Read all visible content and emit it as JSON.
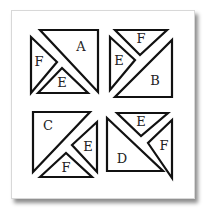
{
  "puzzle": {
    "quadrants": [
      {
        "id": "top-left",
        "pieces": [
          {
            "label": "A",
            "points": "40,30 98,30 98,92",
            "label_x": 81,
            "label_y": 47
          },
          {
            "label": "F",
            "points": "31,37 57,62 31,93",
            "label_x": 39,
            "label_y": 62
          },
          {
            "label": "E",
            "points": "38,93 62,68 88,93",
            "label_x": 62,
            "label_y": 83
          }
        ]
      },
      {
        "id": "top-right",
        "pieces": [
          {
            "label": "F",
            "points": "115,30 167,30 140,55",
            "label_x": 141,
            "label_y": 39
          },
          {
            "label": "E",
            "points": "110,37 135,60 110,90",
            "label_x": 119,
            "label_y": 61
          },
          {
            "label": "B",
            "points": "172,40 172,97 115,97",
            "label_x": 155,
            "label_y": 81
          }
        ]
      },
      {
        "id": "bottom-left",
        "pieces": [
          {
            "label": "C",
            "points": "33,112 90,112 33,172",
            "label_x": 48,
            "label_y": 126
          },
          {
            "label": "E",
            "points": "97,122 72,145 97,172",
            "label_x": 88,
            "label_y": 147
          },
          {
            "label": "F",
            "points": "40,177 66,153 92,177",
            "label_x": 66,
            "label_y": 168
          }
        ]
      },
      {
        "id": "bottom-right",
        "pieces": [
          {
            "label": "E",
            "points": "117,113 168,113 141,136",
            "label_x": 141,
            "label_y": 122
          },
          {
            "label": "F",
            "points": "172,120 148,143 172,178",
            "label_x": 164,
            "label_y": 146
          },
          {
            "label": "D",
            "points": "107,118 107,171 163,171",
            "label_x": 122,
            "label_y": 159
          }
        ]
      }
    ]
  }
}
